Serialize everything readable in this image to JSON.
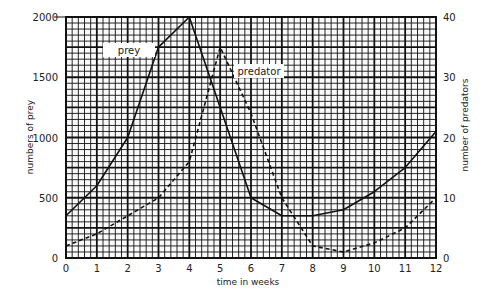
{
  "chart_data": {
    "type": "line",
    "title": "",
    "xlabel": "time in weeks",
    "ylabel": "numbers of prey",
    "y2label": "number of predators",
    "x": [
      0,
      1,
      2,
      3,
      4,
      5,
      6,
      7,
      8,
      9,
      10,
      11,
      12
    ],
    "xlim": [
      0,
      12
    ],
    "ylim": [
      0,
      2000
    ],
    "y2lim": [
      0,
      40
    ],
    "xticks": [
      "0",
      "1",
      "2",
      "3",
      "4",
      "5",
      "6",
      "7",
      "8",
      "9",
      "10",
      "11",
      "12"
    ],
    "yticks": [
      "0",
      "500",
      "1000",
      "1500",
      "2000"
    ],
    "y2ticks": [
      "0",
      "10",
      "20",
      "30",
      "40"
    ],
    "grid": true,
    "series": [
      {
        "name": "prey",
        "axis": "left",
        "style": "solid",
        "values": [
          350,
          600,
          1000,
          1750,
          2000,
          1250,
          500,
          350,
          350,
          400,
          550,
          750,
          1050
        ]
      },
      {
        "name": "predator",
        "axis": "right",
        "style": "dashed",
        "values": [
          2,
          4,
          7,
          10,
          16,
          35,
          24,
          10,
          2,
          1,
          2.5,
          5,
          10
        ]
      }
    ],
    "annotations": [
      {
        "text": "prey",
        "near_series": "prey"
      },
      {
        "text": "predator",
        "near_series": "predator"
      }
    ]
  },
  "labels": {
    "xlabel": "time in weeks",
    "ylabel": "numbers of prey",
    "y2label": "number of predators",
    "prey_tag": "prey",
    "predator_tag": "predator"
  }
}
